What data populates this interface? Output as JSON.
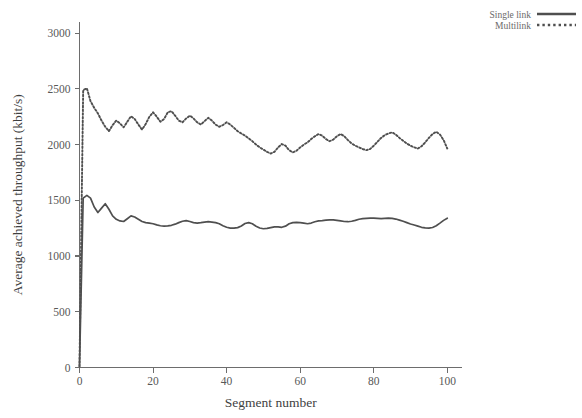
{
  "chart_data": {
    "type": "line",
    "title": "",
    "xlabel": "Segment number",
    "ylabel": "Average achieved throughput (kbit/s)",
    "xlim": [
      0,
      104
    ],
    "ylim": [
      0,
      3100
    ],
    "xticks": [
      0,
      20,
      40,
      60,
      80,
      100
    ],
    "xtick_labels": [
      "0",
      "20",
      "40",
      "60",
      "80",
      "100"
    ],
    "yticks": [
      0,
      500,
      1000,
      1500,
      2000,
      2500,
      3000
    ],
    "ytick_labels": [
      "0",
      "500",
      "1000",
      "1500",
      "2000",
      "2500",
      "3000"
    ],
    "grid": false,
    "legend_position": "top-right",
    "colors": {
      "single_link": "#4f4f4f",
      "multilink": "#4f4f4f",
      "axis": "#6d6d6d",
      "text": "#585858",
      "background": "#ffffff"
    },
    "series": [
      {
        "name": "Single link",
        "style": "solid",
        "x": [
          0,
          1,
          2,
          3,
          4,
          5,
          6,
          7,
          8,
          9,
          10,
          11,
          12,
          13,
          14,
          15,
          16,
          17,
          18,
          19,
          20,
          21,
          22,
          23,
          24,
          25,
          26,
          27,
          28,
          29,
          30,
          31,
          32,
          33,
          34,
          35,
          36,
          37,
          38,
          39,
          40,
          41,
          42,
          43,
          44,
          45,
          46,
          47,
          48,
          49,
          50,
          51,
          52,
          53,
          54,
          55,
          56,
          57,
          58,
          59,
          60,
          61,
          62,
          63,
          64,
          65,
          66,
          67,
          68,
          69,
          70,
          71,
          72,
          73,
          74,
          75,
          76,
          77,
          78,
          79,
          80,
          81,
          82,
          83,
          84,
          85,
          86,
          87,
          88,
          89,
          90,
          91,
          92,
          93,
          94,
          95,
          96,
          97,
          98,
          99,
          100
        ],
        "values": [
          10,
          1520,
          1545,
          1520,
          1440,
          1390,
          1430,
          1470,
          1420,
          1360,
          1330,
          1315,
          1310,
          1335,
          1360,
          1350,
          1330,
          1310,
          1300,
          1295,
          1290,
          1280,
          1272,
          1268,
          1270,
          1276,
          1286,
          1300,
          1312,
          1318,
          1310,
          1300,
          1296,
          1300,
          1305,
          1308,
          1305,
          1300,
          1290,
          1272,
          1258,
          1250,
          1250,
          1255,
          1270,
          1292,
          1300,
          1290,
          1268,
          1252,
          1245,
          1248,
          1255,
          1262,
          1262,
          1258,
          1268,
          1290,
          1300,
          1302,
          1300,
          1295,
          1290,
          1296,
          1308,
          1315,
          1318,
          1322,
          1325,
          1324,
          1320,
          1315,
          1310,
          1308,
          1312,
          1320,
          1330,
          1335,
          1338,
          1340,
          1340,
          1338,
          1336,
          1338,
          1340,
          1338,
          1332,
          1322,
          1312,
          1300,
          1288,
          1278,
          1268,
          1258,
          1252,
          1250,
          1256,
          1272,
          1295,
          1320,
          1340
        ]
      },
      {
        "name": "Multilink",
        "style": "dotted",
        "x": [
          0,
          1,
          2,
          3,
          4,
          5,
          6,
          7,
          8,
          9,
          10,
          11,
          12,
          13,
          14,
          15,
          16,
          17,
          18,
          19,
          20,
          21,
          22,
          23,
          24,
          25,
          26,
          27,
          28,
          29,
          30,
          31,
          32,
          33,
          34,
          35,
          36,
          37,
          38,
          39,
          40,
          41,
          42,
          43,
          44,
          45,
          46,
          47,
          48,
          49,
          50,
          51,
          52,
          53,
          54,
          55,
          56,
          57,
          58,
          59,
          60,
          61,
          62,
          63,
          64,
          65,
          66,
          67,
          68,
          69,
          70,
          71,
          72,
          73,
          74,
          75,
          76,
          77,
          78,
          79,
          80,
          81,
          82,
          83,
          84,
          85,
          86,
          87,
          88,
          89,
          90,
          91,
          92,
          93,
          94,
          95,
          96,
          97,
          98,
          99,
          100
        ],
        "values": [
          10,
          2490,
          2505,
          2390,
          2330,
          2280,
          2215,
          2160,
          2120,
          2175,
          2215,
          2190,
          2155,
          2205,
          2255,
          2230,
          2180,
          2135,
          2185,
          2250,
          2290,
          2250,
          2205,
          2230,
          2290,
          2300,
          2260,
          2215,
          2200,
          2235,
          2260,
          2235,
          2200,
          2180,
          2210,
          2240,
          2215,
          2180,
          2160,
          2175,
          2200,
          2180,
          2150,
          2120,
          2100,
          2080,
          2055,
          2030,
          2000,
          1975,
          1955,
          1935,
          1920,
          1935,
          1975,
          2005,
          1990,
          1950,
          1930,
          1945,
          1975,
          2000,
          2020,
          2050,
          2075,
          2095,
          2080,
          2050,
          2030,
          2045,
          2075,
          2095,
          2075,
          2040,
          2010,
          1990,
          1975,
          1960,
          1950,
          1960,
          1990,
          2025,
          2060,
          2085,
          2100,
          2110,
          2090,
          2060,
          2035,
          2010,
          1990,
          1975,
          1965,
          1985,
          2020,
          2060,
          2095,
          2115,
          2090,
          2040,
          1965
        ]
      }
    ]
  },
  "legend": {
    "entries": [
      {
        "label": "Single link",
        "style": "solid"
      },
      {
        "label": "Multilink",
        "style": "dotted"
      }
    ]
  }
}
